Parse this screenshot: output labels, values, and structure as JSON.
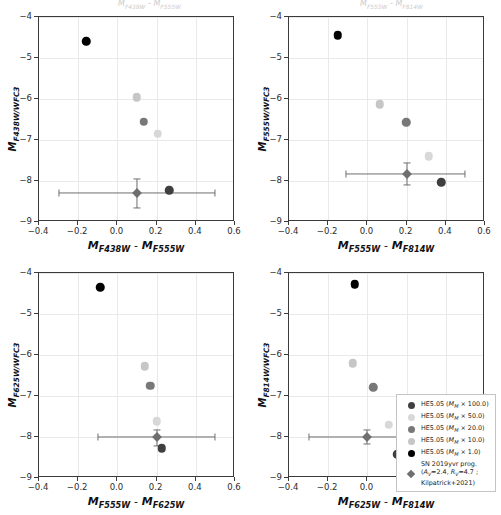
{
  "figure": {
    "background_color": "#ffffff",
    "grid_color": "#e9e9e9",
    "axis_color": "#3a3a3a",
    "clipped_top_text_left": "MF438W - MF555W",
    "clipped_top_text_right": "MF555W - MF814W"
  },
  "colors": {
    "m100": "#3f3f3f",
    "m50": "#d8d8d8",
    "m20": "#787878",
    "m10": "#c6c6c6",
    "m1": "#000000",
    "obs": "#6f6f6f"
  },
  "legend": {
    "position": "lower-right-panel4",
    "entries": [
      {
        "label_prefix": "HE5.05 (",
        "sym": "M",
        "sub": "M",
        "label_suffix": " × 100.0)",
        "marker": "circle",
        "color_key": "m100"
      },
      {
        "label_prefix": "HE5.05 (",
        "sym": "M",
        "sub": "M",
        "label_suffix": " × 50.0)",
        "marker": "circle",
        "color_key": "m50"
      },
      {
        "label_prefix": "HE5.05 (",
        "sym": "M",
        "sub": "M",
        "label_suffix": " × 20.0)",
        "marker": "circle",
        "color_key": "m20"
      },
      {
        "label_prefix": "HE5.05 (",
        "sym": "M",
        "sub": "M",
        "label_suffix": " × 10.0)",
        "marker": "circle",
        "color_key": "m10"
      },
      {
        "label_prefix": "HE5.05 (",
        "sym": "M",
        "sub": "M",
        "label_suffix": " × 1.0)",
        "marker": "circle",
        "color_key": "m1"
      }
    ],
    "obs_entry": {
      "line1": "SN 2019yvr prog.",
      "line2_a": "(A",
      "line2_sub1": "V",
      "line2_b": "=2.4, R",
      "line2_sub2": "V",
      "line2_c": "=4.7 ;",
      "line3": "Kilpatrick+2021)",
      "marker": "diamond",
      "color_key": "obs"
    }
  },
  "chart_data": [
    {
      "type": "scatter",
      "panel": "top-left",
      "title": "",
      "xlabel_m1": "M",
      "xlabel_s1": "F438W",
      "xlabel_m2": "M",
      "xlabel_s2": "F555W",
      "ylabel_m": "M",
      "ylabel_s": "F438W/WFC3",
      "xlim": [
        -0.4,
        0.6
      ],
      "ylim": [
        -4,
        -9
      ],
      "xticks": [
        -0.4,
        -0.2,
        0.0,
        0.2,
        0.4,
        0.6
      ],
      "xticklabels": [
        "−0.4",
        "−0.2",
        "0.0",
        "0.2",
        "0.4",
        "0.6"
      ],
      "yticks": [
        -9,
        -8,
        -7,
        -6,
        -5,
        -4
      ],
      "yticklabels": [
        "−9",
        "−8",
        "−7",
        "−6",
        "−5",
        "−4"
      ],
      "grid": true,
      "series": [
        {
          "name": "HE5.05 (M_M x 100.0)",
          "color_key": "m100",
          "x": 0.265,
          "y": -8.22
        },
        {
          "name": "HE5.05 (M_M x 50.0)",
          "color_key": "m50",
          "x": 0.205,
          "y": -6.85
        },
        {
          "name": "HE5.05 (M_M x 20.0)",
          "color_key": "m20",
          "x": 0.135,
          "y": -6.55
        },
        {
          "name": "HE5.05 (M_M x 10.0)",
          "color_key": "m10",
          "x": 0.098,
          "y": -5.96
        },
        {
          "name": "HE5.05 (M_M x 1.0)",
          "color_key": "m1",
          "x": -0.158,
          "y": -4.59
        }
      ],
      "observation": {
        "name": "SN 2019yvr prog.",
        "x": 0.1,
        "y": -8.3,
        "xerr_low": 0.4,
        "xerr_high": 0.4,
        "yerr_low": 0.35,
        "yerr_high": 0.35
      }
    },
    {
      "type": "scatter",
      "panel": "top-right",
      "title": "",
      "xlabel_m1": "M",
      "xlabel_s1": "F555W",
      "xlabel_m2": "M",
      "xlabel_s2": "F814W",
      "ylabel_m": "M",
      "ylabel_s": "F555W/WFC3",
      "xlim": [
        -0.4,
        0.6
      ],
      "ylim": [
        -4,
        -9
      ],
      "xticks": [
        -0.4,
        -0.2,
        0.0,
        0.2,
        0.4,
        0.6
      ],
      "xticklabels": [
        "−0.4",
        "−0.2",
        "0.0",
        "0.2",
        "0.4",
        "0.6"
      ],
      "yticks": [
        -9,
        -8,
        -7,
        -6,
        -5,
        -4
      ],
      "yticklabels": [
        "−9",
        "−8",
        "−7",
        "−6",
        "−5",
        "−4"
      ],
      "grid": true,
      "series": [
        {
          "name": "HE5.05 (M_M x 100.0)",
          "color_key": "m100",
          "x": 0.378,
          "y": -8.03
        },
        {
          "name": "HE5.05 (M_M x 50.0)",
          "color_key": "m50",
          "x": 0.313,
          "y": -7.4
        },
        {
          "name": "HE5.05 (M_M x 20.0)",
          "color_key": "m20",
          "x": 0.198,
          "y": -6.57
        },
        {
          "name": "HE5.05 (M_M x 10.0)",
          "color_key": "m10",
          "x": 0.063,
          "y": -6.13
        },
        {
          "name": "HE5.05 (M_M x 1.0)",
          "color_key": "m1",
          "x": -0.152,
          "y": -4.44
        }
      ],
      "observation": {
        "name": "SN 2019yvr prog.",
        "x": 0.2,
        "y": -7.82,
        "xerr_low": 0.31,
        "xerr_high": 0.3,
        "yerr_low": 0.28,
        "yerr_high": 0.25
      }
    },
    {
      "type": "scatter",
      "panel": "bottom-left",
      "title": "",
      "xlabel_m1": "M",
      "xlabel_s1": "F555W",
      "xlabel_m2": "M",
      "xlabel_s2": "F625W",
      "ylabel_m": "M",
      "ylabel_s": "F625W/WFC3",
      "xlim": [
        -0.4,
        0.6
      ],
      "ylim": [
        -4,
        -9
      ],
      "xticks": [
        -0.4,
        -0.2,
        0.0,
        0.2,
        0.4,
        0.6
      ],
      "xticklabels": [
        "−0.4",
        "−0.2",
        "0.0",
        "0.2",
        "0.4",
        "0.6"
      ],
      "yticks": [
        -9,
        -8,
        -7,
        -6,
        -5,
        -4
      ],
      "yticklabels": [
        "−9",
        "−8",
        "−7",
        "−6",
        "−5",
        "−4"
      ],
      "grid": true,
      "series": [
        {
          "name": "HE5.05 (M_M x 100.0)",
          "color_key": "m100",
          "x": 0.225,
          "y": -8.27
        },
        {
          "name": "HE5.05 (M_M x 50.0)",
          "color_key": "m50",
          "x": 0.2,
          "y": -7.61
        },
        {
          "name": "HE5.05 (M_M x 20.0)",
          "color_key": "m20",
          "x": 0.167,
          "y": -6.75
        },
        {
          "name": "HE5.05 (M_M x 10.0)",
          "color_key": "m10",
          "x": 0.14,
          "y": -6.28
        },
        {
          "name": "HE5.05 (M_M x 1.0)",
          "color_key": "m1",
          "x": -0.088,
          "y": -4.35
        }
      ],
      "observation": {
        "name": "SN 2019yvr prog.",
        "x": 0.2,
        "y": -8.0,
        "xerr_low": 0.3,
        "xerr_high": 0.3,
        "yerr_low": 0.22,
        "yerr_high": 0.18
      }
    },
    {
      "type": "scatter",
      "panel": "bottom-right",
      "title": "",
      "xlabel_m1": "M",
      "xlabel_s1": "F625W",
      "xlabel_m2": "M",
      "xlabel_s2": "F814W",
      "ylabel_m": "M",
      "ylabel_s": "F814W/WFC3",
      "xlim": [
        -0.4,
        0.6
      ],
      "ylim": [
        -4,
        -9
      ],
      "xticks": [
        -0.4,
        -0.2,
        0.0,
        0.2,
        0.4,
        0.6
      ],
      "xticklabels": [
        "−0.4",
        "−0.2",
        "0.0",
        "0.2",
        "0.4",
        "0.6"
      ],
      "yticks": [
        -9,
        -8,
        -7,
        -6,
        -5,
        -4
      ],
      "yticklabels": [
        "−9",
        "−8",
        "−7",
        "−6",
        "−5",
        "−4"
      ],
      "grid": true,
      "series": [
        {
          "name": "HE5.05 (M_M x 100.0)",
          "color_key": "m100",
          "x": 0.152,
          "y": -8.42
        },
        {
          "name": "HE5.05 (M_M x 50.0)",
          "color_key": "m50",
          "x": 0.108,
          "y": -7.7
        },
        {
          "name": "HE5.05 (M_M x 20.0)",
          "color_key": "m20",
          "x": 0.03,
          "y": -6.79
        },
        {
          "name": "HE5.05 (M_M x 10.0)",
          "color_key": "m10",
          "x": -0.075,
          "y": -6.2
        },
        {
          "name": "HE5.05 (M_M x 1.0)",
          "color_key": "m1",
          "x": -0.065,
          "y": -4.28
        }
      ],
      "observation": {
        "name": "SN 2019yvr prog.",
        "x": 0.0,
        "y": -8.0,
        "xerr_low": 0.3,
        "xerr_high": 0.3,
        "yerr_low": 0.18,
        "yerr_high": 0.18
      }
    }
  ]
}
